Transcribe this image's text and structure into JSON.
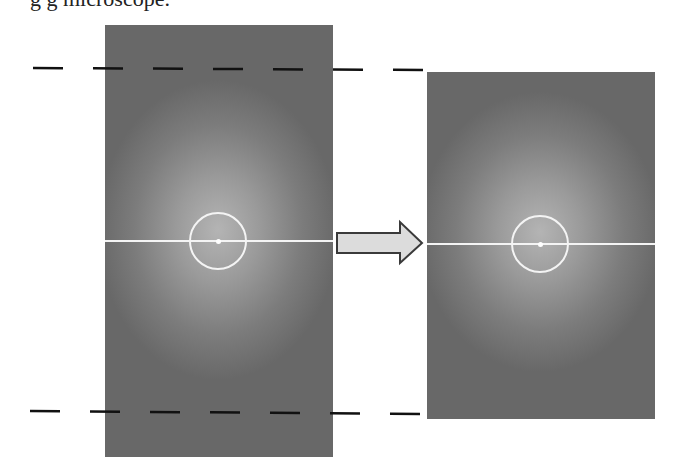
{
  "figure": {
    "caption_fragment": "g  g                                  microscope.",
    "arrow": {
      "label": "",
      "direction": "right",
      "fill": "#d9d9d9",
      "stroke": "#3a3a3a"
    },
    "colors": {
      "panel_center": "#b0b0b0",
      "panel_edge": "#666666",
      "line": "#f4f4f4",
      "dash": "#111111"
    },
    "left_panel": {
      "name": "original-field",
      "x": 105,
      "y": 25,
      "width": 228,
      "height": 432,
      "center": {
        "x": 113,
        "y": 216
      },
      "circle_radius": 29,
      "line_y": 216
    },
    "right_panel": {
      "name": "cropped-field",
      "x": 427,
      "y": 72,
      "width": 228,
      "height": 347,
      "center": {
        "x": 113,
        "y": 172
      },
      "circle_radius": 29,
      "line_y": 172
    },
    "dashed_lines": [
      {
        "name": "top-crop-boundary",
        "y": 68,
        "x_start": 33,
        "x_end": 425
      },
      {
        "name": "bottom-crop-boundary",
        "y": 412,
        "x_start": 30,
        "x_end": 425
      }
    ]
  }
}
